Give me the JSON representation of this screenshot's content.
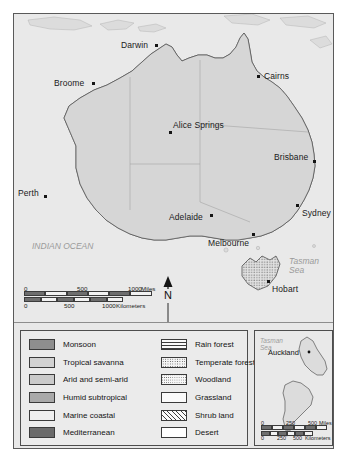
{
  "figure": {
    "background_color": "#e8e8e8",
    "frame_color": "#5a5a5a"
  },
  "map": {
    "region": "Australia",
    "ocean_labels": [
      {
        "name": "indian-ocean",
        "text": "INDIAN OCEAN"
      },
      {
        "name": "tasman-sea",
        "line1": "Tasman",
        "line2": "Sea"
      }
    ],
    "cities": [
      {
        "name": "darwin",
        "label": "Darwin"
      },
      {
        "name": "broome",
        "label": "Broome"
      },
      {
        "name": "cairns",
        "label": "Cairns"
      },
      {
        "name": "alice-springs",
        "label": "Alice Springs"
      },
      {
        "name": "brisbane",
        "label": "Brisbane"
      },
      {
        "name": "perth",
        "label": "Perth"
      },
      {
        "name": "adelaide",
        "label": "Adelaide"
      },
      {
        "name": "sydney",
        "label": "Sydney"
      },
      {
        "name": "melbourne",
        "label": "Melbourne"
      },
      {
        "name": "hobart",
        "label": "Hobart"
      }
    ],
    "north_arrow": {
      "label": "N"
    },
    "scale": {
      "miles": {
        "ticks": [
          "0",
          "500",
          "1000"
        ],
        "unit": "Miles"
      },
      "kilometers": {
        "ticks": [
          "0",
          "500",
          "1000"
        ],
        "unit": "Kilometers"
      }
    }
  },
  "legend": {
    "climate": [
      {
        "key": "monsoon",
        "label": "Monsoon",
        "color": "#8e8e8e"
      },
      {
        "key": "tropical-savanna",
        "label": "Tropical savanna",
        "color": "#d2d2d2"
      },
      {
        "key": "arid-and-semi-arid",
        "label": "Arid and semi-arid",
        "color": "#cacaca"
      },
      {
        "key": "humid-subtropical",
        "label": "Humid subtropical",
        "color": "#a9a9a9"
      },
      {
        "key": "marine-coastal",
        "label": "Marine coastal",
        "color": "#efefef"
      },
      {
        "key": "mediterranean",
        "label": "Mediterranean",
        "color": "#6a6a6a"
      }
    ],
    "vegetation": [
      {
        "key": "rain-forest",
        "label": "Rain forest",
        "pattern": "horizontal-lines"
      },
      {
        "key": "temperate-forest",
        "label": "Temperate forest",
        "pattern": "dotted"
      },
      {
        "key": "woodland",
        "label": "Woodland",
        "pattern": "stipple"
      },
      {
        "key": "grassland",
        "label": "Grassland",
        "pattern": "dashes"
      },
      {
        "key": "shrub-land",
        "label": "Shrub land",
        "pattern": "diagonal-hatch"
      },
      {
        "key": "desert",
        "label": "Desert",
        "pattern": "blank"
      }
    ]
  },
  "inset": {
    "region": "New Zealand",
    "ocean_label": {
      "line1": "Tasman",
      "line2": "Sea"
    },
    "city": {
      "name": "auckland",
      "label": "Auckland"
    },
    "scale": {
      "miles": {
        "ticks": [
          "0",
          "250",
          "500"
        ],
        "unit": "Miles"
      },
      "kilometers": {
        "ticks": [
          "0",
          "250",
          "500"
        ],
        "unit": "Kilometers"
      }
    }
  }
}
